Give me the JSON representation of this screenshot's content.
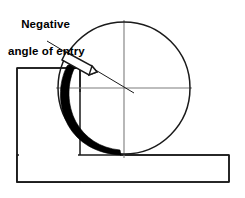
{
  "figure": {
    "title": "Negative angle of entry",
    "background_color": "#ffffff",
    "width": 245,
    "height": 198
  },
  "annotation": {
    "line1": "Negative",
    "line2": "angle of entry"
  },
  "colors": {
    "outline": "#1a1a1a",
    "weld_bead_fill": "#000000",
    "centerline": "#7d7d7d",
    "workpiece_fill": "#ffffff",
    "electrode_fill": "#ffffff",
    "background": "#ffffff"
  },
  "geometry": {
    "roller": {
      "name": "roller-circle",
      "center_x": 124,
      "center_y": 88,
      "radius": 66,
      "stroke_width": 1.4
    },
    "centerlines": {
      "horizontal": {
        "x1": 56,
        "y1": 88,
        "x2": 192,
        "y2": 88
      },
      "vertical": {
        "x1": 124,
        "y1": 20,
        "x2": 124,
        "y2": 158
      }
    },
    "left_workpiece": {
      "name": "left-workpiece",
      "x": 17,
      "y": 68,
      "right": 80,
      "bottom": 182
    },
    "bottom_workpiece": {
      "name": "bottom-workpiece",
      "x": 17,
      "y": 155,
      "right": 229,
      "bottom": 182
    },
    "weld_bead": {
      "name": "weld-bead-crescent",
      "description": "black tapering crescent along lower-left arc of roller",
      "thickness_max": 17,
      "start_angle_deg": 172,
      "end_angle_deg": 272
    },
    "electrode": {
      "name": "electrode",
      "angle_deg": 38,
      "length": 36,
      "width": 11,
      "tip_x": 70,
      "tip_y": 55
    },
    "leader_line": {
      "name": "reference-leader-line",
      "x1": 47,
      "y1": 42,
      "x2": 132,
      "y2": 92
    }
  },
  "labels": {
    "roller": "roller-circle",
    "weld_bead": "weld-bead",
    "electrode": "electrode-tool",
    "left_workpiece": "left-workpiece",
    "bottom_workpiece": "bottom-workpiece",
    "centerline_h": "horizontal-centerline",
    "centerline_v": "vertical-centerline"
  }
}
